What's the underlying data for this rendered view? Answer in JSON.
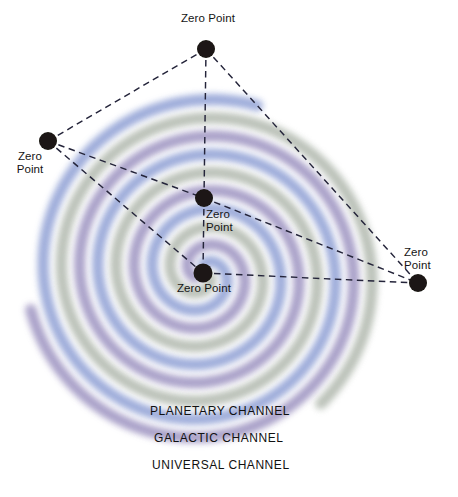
{
  "diagram": {
    "background_color": "#ffffff"
  },
  "chart_data": {
    "type": "diagram",
    "center": {
      "x": 203,
      "y": 273
    },
    "bands": [
      {
        "name": "blue-band",
        "color": "#8e9fd4"
      },
      {
        "name": "sage-band",
        "color": "#b0b8ad"
      },
      {
        "name": "purple-band",
        "color": "#9b92c0"
      }
    ],
    "nodes": [
      {
        "id": "top",
        "label": "Zero Point",
        "x": 206,
        "y": 49
      },
      {
        "id": "left",
        "label": "Zero Point",
        "x": 48,
        "y": 141
      },
      {
        "id": "middle",
        "label": "Zero Point",
        "x": 204,
        "y": 198
      },
      {
        "id": "center",
        "label": "Zero Point",
        "x": 203,
        "y": 273
      },
      {
        "id": "right",
        "label": "Zero Point",
        "x": 418,
        "y": 283
      }
    ],
    "edges": [
      {
        "from": "top",
        "to": "left"
      },
      {
        "from": "top",
        "to": "middle"
      },
      {
        "from": "top",
        "to": "right"
      },
      {
        "from": "left",
        "to": "middle"
      },
      {
        "from": "left",
        "to": "center"
      },
      {
        "from": "middle",
        "to": "center"
      },
      {
        "from": "middle",
        "to": "right"
      },
      {
        "from": "center",
        "to": "right"
      }
    ],
    "channels": [
      "PLANETARY CHANNEL",
      "GALACTIC CHANNEL",
      "UNIVERSAL CHANNEL"
    ]
  },
  "nodes": {
    "top": {
      "label": "Zero Point"
    },
    "left": {
      "label_line1": "Zero",
      "label_line2": "Point"
    },
    "middle": {
      "label_line1": "Zero",
      "label_line2": "Point"
    },
    "center": {
      "label": "Zero Point"
    },
    "right": {
      "label_line1": "Zero",
      "label_line2": "Point"
    }
  },
  "channels": {
    "planetary": "PLANETARY CHANNEL",
    "galactic": "GALACTIC CHANNEL",
    "universal": "UNIVERSAL CHANNEL"
  },
  "colors": {
    "blue": "#8e9fd4",
    "sage": "#b0b8ad",
    "purple": "#9b92c0",
    "node": "#1a1512",
    "dash": "#24243a",
    "text": "#121212"
  }
}
